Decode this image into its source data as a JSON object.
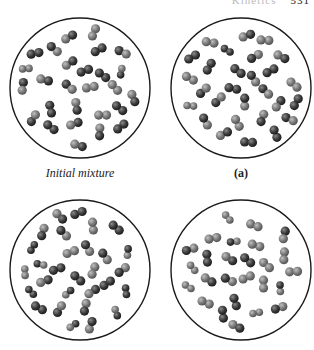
{
  "header": {
    "left_fragment": "Kinetics",
    "right_fragment": "531"
  },
  "panels": [
    {
      "id": "initial",
      "caption": "Initial mixture",
      "caption_style": "italic",
      "cx": 80,
      "cy": 88
    },
    {
      "id": "a",
      "caption": "(a)",
      "caption_style": "bold",
      "cx": 241,
      "cy": 88
    },
    {
      "id": "b",
      "caption": "",
      "caption_style": "",
      "cx": 80,
      "cy": 270
    },
    {
      "id": "c",
      "caption": "",
      "caption_style": "",
      "cx": 241,
      "cy": 270
    }
  ],
  "colors": {
    "circle_stroke": "#1a1a1a",
    "dark_atom": "#3a3a3a",
    "light_atom": "#7a7a7a",
    "background": "#ffffff"
  },
  "legend": {
    "molecule_types": [
      "homonuclear-dark (A2)",
      "heteronuclear (AB)",
      "homonuclear-light (B2)"
    ]
  }
}
